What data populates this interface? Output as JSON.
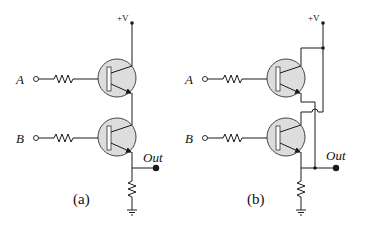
{
  "figure": {
    "colors": {
      "wire": "#1a1a1a",
      "transistor_fill": "#dddddd",
      "background": "#ffffff"
    },
    "circuits": [
      {
        "id": "a",
        "caption": "(a)",
        "supply_label": "+V",
        "input_labels": [
          "A",
          "B"
        ],
        "output_label": "Out",
        "topology": "series (AND)"
      },
      {
        "id": "b",
        "caption": "(b)",
        "supply_label": "+V",
        "input_labels": [
          "A",
          "B"
        ],
        "output_label": "Out",
        "topology": "parallel (OR)"
      }
    ]
  }
}
